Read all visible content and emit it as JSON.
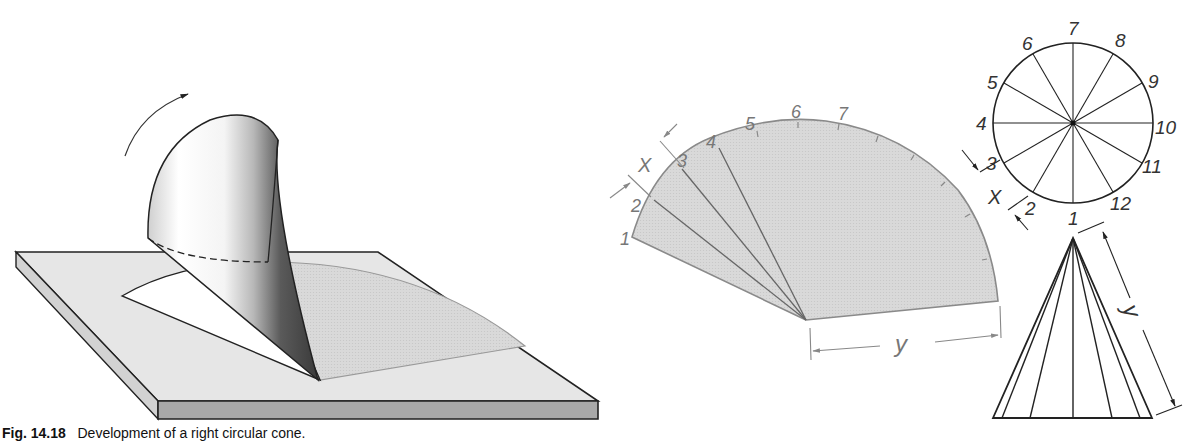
{
  "figure": {
    "caption_number": "Fig. 14.18",
    "caption_text": "Development of a right circular cone."
  },
  "isometric_view": {
    "description": "Cone rolled on a flat plate to trace its development",
    "rotation_arrow": "curved-arrow"
  },
  "development": {
    "division_labels": [
      "1",
      "2",
      "3",
      "4",
      "5",
      "6",
      "7"
    ],
    "dimension_x": "X",
    "dimension_y": "y",
    "fill_color": "#d6d6d6",
    "edge_color": "#8a8a8a"
  },
  "top_view": {
    "division_labels": [
      "1",
      "2",
      "3",
      "4",
      "5",
      "6",
      "7",
      "8",
      "9",
      "10",
      "11",
      "12"
    ],
    "dimension_x": "X"
  },
  "front_view": {
    "dimension_y": "y"
  }
}
